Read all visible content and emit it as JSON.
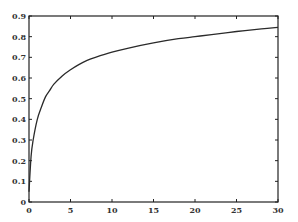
{
  "chart_data": {
    "type": "line",
    "title": "",
    "xlabel": "",
    "ylabel": "",
    "xlim": [
      0,
      30
    ],
    "ylim": [
      0,
      0.9
    ],
    "grid": false,
    "legend": null,
    "x_ticks": [
      0,
      5,
      10,
      15,
      20,
      25,
      30
    ],
    "x_tick_labels": [
      "0",
      "5",
      "10",
      "15",
      "20",
      "25",
      "30"
    ],
    "y_ticks": [
      0,
      0.1,
      0.2,
      0.3,
      0.4,
      0.5,
      0.6,
      0.7,
      0.8,
      0.9
    ],
    "y_tick_labels": [
      "0",
      "0.1",
      "0.2",
      "0.3",
      "0.4",
      "0.5",
      "0.6",
      "0.7",
      "0.8",
      "0.9"
    ],
    "series": [
      {
        "name": "curve",
        "x": [
          0,
          0.25,
          0.5,
          1,
          1.5,
          2,
          2.5,
          3,
          4,
          5,
          6,
          7,
          8,
          10,
          12,
          15,
          18,
          20,
          22,
          25,
          28,
          30
        ],
        "y": [
          0.05,
          0.22,
          0.3,
          0.4,
          0.46,
          0.51,
          0.54,
          0.57,
          0.61,
          0.64,
          0.665,
          0.685,
          0.7,
          0.725,
          0.745,
          0.77,
          0.79,
          0.8,
          0.81,
          0.825,
          0.838,
          0.845
        ]
      }
    ]
  },
  "plot_area": {
    "left": 29,
    "top": 16,
    "right": 278,
    "bottom": 202
  }
}
